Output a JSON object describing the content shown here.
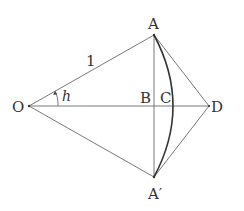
{
  "diagram": {
    "points": {
      "O": {
        "label": "O",
        "x": 29,
        "y": 106
      },
      "A": {
        "label": "A",
        "x": 154,
        "y": 35
      },
      "A_prime": {
        "label": "A′",
        "x": 154,
        "y": 177
      },
      "B": {
        "label": "B",
        "x": 154,
        "y": 106
      },
      "C": {
        "label": "C",
        "x": 173,
        "y": 106
      },
      "D": {
        "label": "D",
        "x": 209,
        "y": 106
      }
    },
    "labels": {
      "O": "O",
      "A": "A",
      "A_prime": "A′",
      "B": "B",
      "C": "C",
      "D": "D",
      "radius": "1",
      "angle": "h"
    },
    "segments": [
      {
        "from": "O",
        "to": "A",
        "note": "radius, length 1"
      },
      {
        "from": "O",
        "to": "A_prime"
      },
      {
        "from": "O",
        "to": "D"
      },
      {
        "from": "A",
        "to": "A_prime",
        "note": "chord, vertical through B"
      },
      {
        "from": "A",
        "to": "D"
      },
      {
        "from": "A_prime",
        "to": "D"
      }
    ],
    "arcs": [
      {
        "center": "O",
        "from": "A",
        "to": "A_prime",
        "through": "C",
        "style": "bold"
      },
      {
        "center": "O",
        "note": "angle marker h between OD and OA, with arrowhead"
      }
    ],
    "colors": {
      "line": "#6a6a6a",
      "arc": "#333333",
      "text": "#333333",
      "background": "#ffffff"
    }
  }
}
